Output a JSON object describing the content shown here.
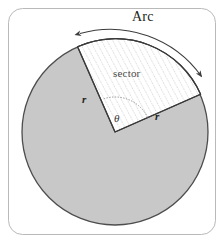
{
  "figure": {
    "background_color": "#ffffff",
    "frame": {
      "name": "rounded-border-frame",
      "stroke_color": "#b9b9b9",
      "x": 8,
      "y": 8,
      "width": 208,
      "height": 227,
      "radius": 14
    },
    "circle": {
      "name": "main-circle",
      "center_x": 115,
      "center_y": 132,
      "radius": 93,
      "fill_color": "#c8c8c8",
      "stroke_color": "#4d4d4d"
    },
    "sector": {
      "name": "hatched-sector",
      "fill_color": "#ffffff",
      "hatch_color": "#9a9a9a",
      "start_angle_deg": 205,
      "end_angle_deg": 295,
      "vertex_x": 115,
      "vertex_y": 132
    },
    "arc_arrow": {
      "name": "arc-double-arrow",
      "stroke_color": "#3d3d3d"
    }
  },
  "labels": {
    "arc": "Arc",
    "sector": "sector",
    "radius_left": "r",
    "radius_right": "r",
    "angle": "θ"
  }
}
